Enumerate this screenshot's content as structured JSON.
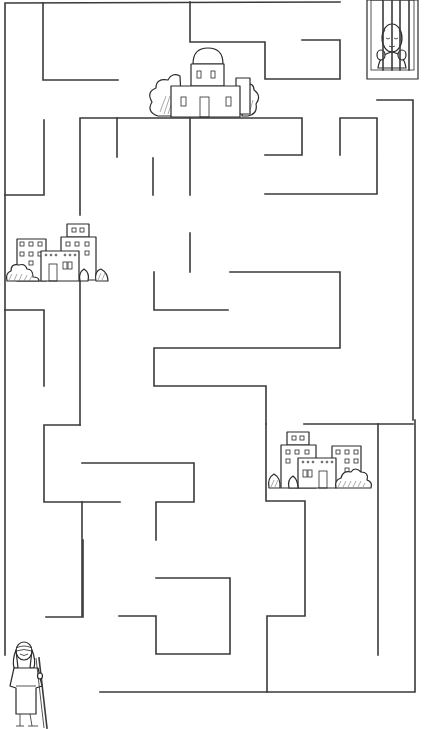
{
  "puzzle": {
    "title": "Maze",
    "start_label": "Traveler with staff",
    "finish_label": "Prisoner behind bars",
    "landmarks": [
      {
        "id": "domed-building",
        "label": "Domed house"
      },
      {
        "id": "city-left",
        "label": "City buildings"
      },
      {
        "id": "city-right",
        "label": "City buildings"
      }
    ],
    "colors": {
      "background": "#ffffff",
      "line": "#3a3a3a"
    }
  }
}
